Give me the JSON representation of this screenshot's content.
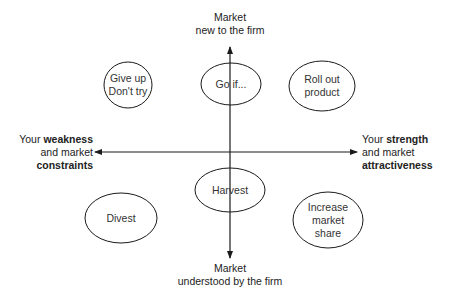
{
  "axes": {
    "top": {
      "line1": "Market",
      "line2": "new to the firm"
    },
    "bottom": {
      "line1": "Market",
      "line2": "understood by the firm"
    },
    "left": {
      "prefix": "Your ",
      "bold1": "weakness",
      "line2": "and market",
      "bold2": "constraints"
    },
    "right": {
      "prefix": "Your ",
      "bold1": "strength",
      "line2": "and market",
      "bold2": "attractiveness"
    }
  },
  "nodes": {
    "give_up": {
      "line1": "Give up",
      "line2": "Don't try"
    },
    "go_if": {
      "line1": "Go if..."
    },
    "roll_out": {
      "line1": "Roll out",
      "line2": "product"
    },
    "divest": {
      "line1": "Divest"
    },
    "harvest": {
      "line1": "Harvest"
    },
    "increase_share": {
      "line1": "Increase",
      "line2": "market",
      "line3": "share"
    }
  },
  "colors": {
    "stroke": "#1a1a1a",
    "background": "#ffffff"
  }
}
